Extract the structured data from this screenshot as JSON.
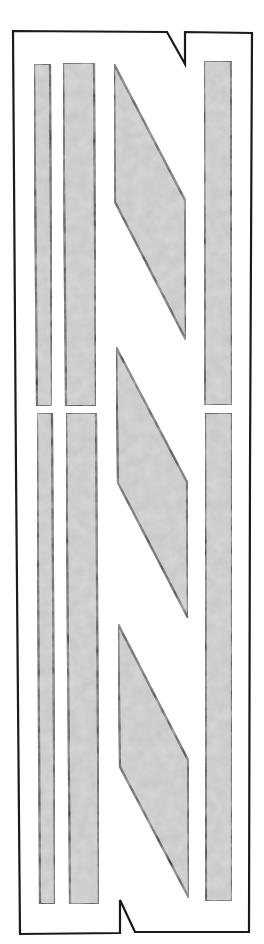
{
  "diagram": {
    "colors": {
      "background": "#ffffff",
      "stroke": "#141414",
      "fill": "#c6c6c6",
      "fill_texture_light": "#d8d8d8",
      "fill_texture_dark": "#b4b4b4"
    },
    "frame": {
      "points": "13,31 167,32 185,64 185,32 252,33 250,470 249,932 135,932 120,900 120,933 20,934 16,470"
    },
    "left_strips_narrow": [
      {
        "id": "narrow-upper",
        "points": "34,64 50,64 52,406 37,406"
      },
      {
        "id": "narrow-lower",
        "points": "37,413 52,413 55,904 40,904"
      }
    ],
    "left_strips_wide": [
      {
        "id": "wide-upper",
        "points": "63,63 94,63 96,406 66,406"
      },
      {
        "id": "wide-lower",
        "points": "66,413 96,413 99,904 70,904"
      }
    ],
    "parallelograms": [
      {
        "id": "para-1",
        "points": "114,64 185,200 186,340 115,202"
      },
      {
        "id": "para-2",
        "points": "116,347 187,482 188,618 118,483"
      },
      {
        "id": "para-3",
        "points": "118,624 188,760 189,898 120,767"
      }
    ],
    "right_strips": [
      {
        "id": "right-upper",
        "points": "204,61 231,61 232,405 205,405"
      },
      {
        "id": "right-lower",
        "points": "205,413 232,413 232,901 206,901"
      }
    ]
  }
}
